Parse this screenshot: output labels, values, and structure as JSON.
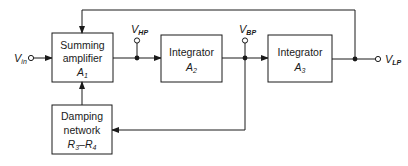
{
  "diagram": {
    "type": "block-diagram",
    "blocks": [
      {
        "id": "summing",
        "lines": [
          "Summing",
          "amplifier"
        ],
        "symbol": "A",
        "symbol_sub": "1"
      },
      {
        "id": "integrator2",
        "lines": [
          "Integrator"
        ],
        "symbol": "A",
        "symbol_sub": "2"
      },
      {
        "id": "integrator3",
        "lines": [
          "Integrator"
        ],
        "symbol": "A",
        "symbol_sub": "3"
      },
      {
        "id": "damping",
        "lines": [
          "Damping",
          "network"
        ],
        "symbol": "R",
        "symbol_sub": "3",
        "symbol2": "R",
        "symbol2_sub": "4",
        "range_sep": "–"
      }
    ],
    "terminals": {
      "input": {
        "label": "V",
        "sub": "in"
      },
      "hp": {
        "label": "V",
        "sub": "HP"
      },
      "bp": {
        "label": "V",
        "sub": "BP"
      },
      "lp": {
        "label": "V",
        "sub": "LP"
      }
    },
    "colors": {
      "line": "#1a1a1a",
      "background": "#ffffff"
    }
  }
}
